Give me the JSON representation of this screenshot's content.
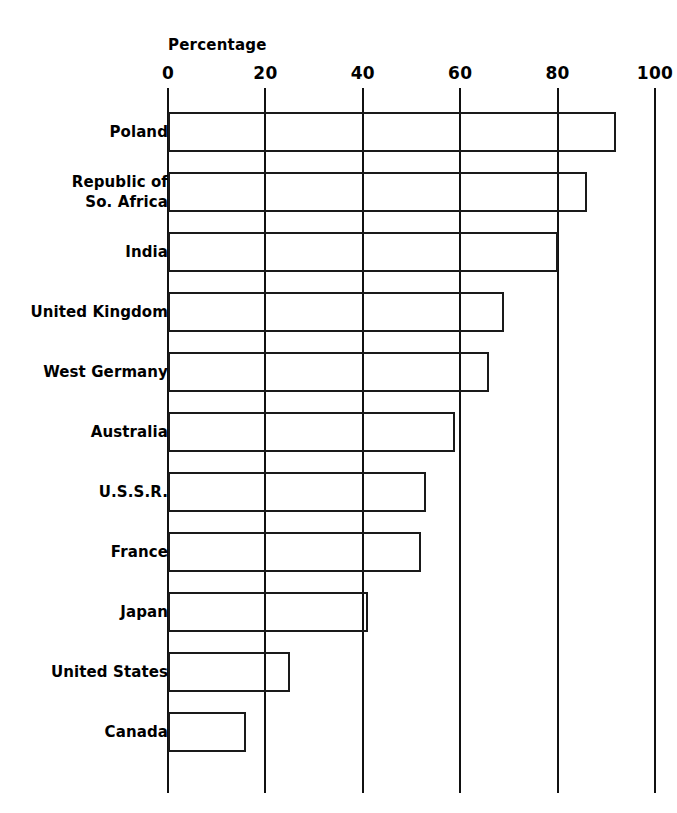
{
  "chart_data": {
    "type": "bar",
    "orientation": "horizontal",
    "title": "",
    "xlabel": "Percentage",
    "ylabel": "",
    "xlim": [
      0,
      100
    ],
    "xticks": [
      0,
      20,
      40,
      60,
      80,
      100
    ],
    "xtick_labels": [
      "0",
      "20",
      "40",
      "60",
      "80",
      "100"
    ],
    "grid": true,
    "legend": false,
    "categories": [
      "Poland",
      "Republic of\nSo. Africa",
      "India",
      "United Kingdom",
      "West Germany",
      "Australia",
      "U.S.S.R.",
      "France",
      "Japan",
      "United States",
      "Canada"
    ],
    "values": [
      92,
      86,
      80,
      69,
      66,
      59,
      53,
      52,
      41,
      25,
      16
    ],
    "bar_style": {
      "fill": "none",
      "stroke": "#1a1a1a",
      "stroke_width": 2
    }
  },
  "axis": {
    "title": "Percentage"
  }
}
